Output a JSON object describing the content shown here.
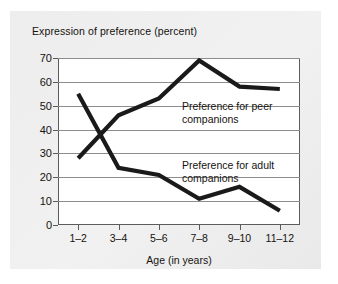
{
  "figure": {
    "background": "#ffffff",
    "card_background": "#eeeeee",
    "title": "Expression of preference (percent)"
  },
  "chart_data": {
    "type": "line",
    "title": "Expression of preference (percent)",
    "xlabel": "Age (in years)",
    "ylabel": "Expression of preference (percent)",
    "categories": [
      "1–2",
      "3–4",
      "5–6",
      "7–8",
      "9–10",
      "11–12"
    ],
    "yticks": [
      0,
      10,
      20,
      30,
      40,
      50,
      60,
      70
    ],
    "ylim": [
      0,
      70
    ],
    "grid": true,
    "legend_position": "inline-annotations",
    "line_color": "#1a1a1a",
    "series": [
      {
        "name": "Preference for peer companions",
        "values": [
          28,
          46,
          53,
          69,
          58,
          57
        ]
      },
      {
        "name": "Preference for adult companions",
        "values": [
          55,
          24,
          21,
          11,
          16,
          6
        ]
      }
    ],
    "annotations": [
      {
        "id": "peer",
        "line1": "Preference for peer",
        "line2": "companions",
        "full": "Preference for peer companions"
      },
      {
        "id": "adult",
        "line1": "Preference for adult",
        "line2": "companions",
        "full": "Preference for adult companions"
      }
    ]
  },
  "axis": {
    "y_tick_labels": [
      "70",
      "60",
      "50",
      "40",
      "30",
      "20",
      "10",
      "0"
    ],
    "x_tick_labels": [
      "1–2",
      "3–4",
      "5–6",
      "7–8",
      "9–10",
      "11–12"
    ],
    "x_title": "Age (in years)"
  }
}
